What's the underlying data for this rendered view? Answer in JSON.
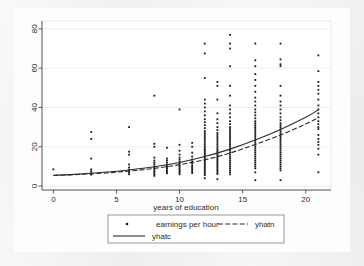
{
  "chart_data": {
    "type": "scatter",
    "title": "",
    "subtitle": "",
    "xlabel": "years of education",
    "ylabel": "",
    "xlim": [
      -0.9,
      22.0
    ],
    "ylim": [
      -2.0,
      84.0
    ],
    "xticks": [
      0,
      5,
      10,
      15,
      20
    ],
    "xtick_labels": [
      "0",
      "5",
      "10",
      "15",
      "20"
    ],
    "yticks": [
      0,
      20,
      40,
      60,
      80
    ],
    "ytick_labels": [
      "0",
      "20",
      "40",
      "60",
      "80"
    ],
    "grid": "horizontal-faint",
    "legend_position": "below-plot",
    "ytick_label_rotation": 90,
    "series": [
      {
        "name": "earnings per hour",
        "type": "scatter",
        "marker": "dot",
        "color": "#1a1a1a",
        "points": [
          [
            0,
            8.5
          ],
          [
            3,
            27.5
          ],
          [
            3,
            24.0
          ],
          [
            3,
            14.0
          ],
          [
            3,
            8.5
          ],
          [
            3,
            7.5
          ],
          [
            3,
            6.6
          ],
          [
            3,
            5.8
          ],
          [
            6,
            30.0
          ],
          [
            6,
            17.5
          ],
          [
            6,
            16.0
          ],
          [
            6,
            11.0
          ],
          [
            6,
            9.5
          ],
          [
            6,
            8.4
          ],
          [
            6,
            7.5
          ],
          [
            6,
            6.8
          ],
          [
            6,
            6.0
          ],
          [
            8,
            46.0
          ],
          [
            8,
            21.5
          ],
          [
            8,
            20.0
          ],
          [
            8,
            14.5
          ],
          [
            8,
            13.0
          ],
          [
            8,
            12.0
          ],
          [
            8,
            11.0
          ],
          [
            8,
            10.0
          ],
          [
            8,
            9.2
          ],
          [
            8,
            8.4
          ],
          [
            8,
            7.6
          ],
          [
            8,
            6.8
          ],
          [
            8,
            6.0
          ],
          [
            8,
            5.2
          ],
          [
            9,
            19.5
          ],
          [
            9,
            14.0
          ],
          [
            9,
            13.0
          ],
          [
            9,
            12.0
          ],
          [
            9,
            11.0
          ],
          [
            9,
            10.2
          ],
          [
            9,
            9.5
          ],
          [
            9,
            8.8
          ],
          [
            9,
            8.0
          ],
          [
            9,
            7.2
          ],
          [
            9,
            6.5
          ],
          [
            10,
            39.0
          ],
          [
            10,
            21.0
          ],
          [
            10,
            18.0
          ],
          [
            10,
            16.0
          ],
          [
            10,
            14.5
          ],
          [
            10,
            13.5
          ],
          [
            10,
            12.5
          ],
          [
            10,
            11.5
          ],
          [
            10,
            10.5
          ],
          [
            10,
            9.8
          ],
          [
            10,
            9.0
          ],
          [
            10,
            8.2
          ],
          [
            10,
            7.5
          ],
          [
            10,
            6.8
          ],
          [
            10,
            6.0
          ],
          [
            11,
            22.0
          ],
          [
            11,
            20.0
          ],
          [
            11,
            17.0
          ],
          [
            11,
            15.0
          ],
          [
            11,
            13.5
          ],
          [
            11,
            12.5
          ],
          [
            11,
            11.5
          ],
          [
            11,
            10.5
          ],
          [
            11,
            9.8
          ],
          [
            11,
            9.0
          ],
          [
            11,
            8.2
          ],
          [
            11,
            7.4
          ],
          [
            11,
            6.6
          ],
          [
            12,
            72.5
          ],
          [
            12,
            67.5
          ],
          [
            12,
            55.0
          ],
          [
            12,
            44.0
          ],
          [
            12,
            42.0
          ],
          [
            12,
            40.0
          ],
          [
            12,
            38.0
          ],
          [
            12,
            36.0
          ],
          [
            12,
            34.0
          ],
          [
            12,
            32.5
          ],
          [
            12,
            31.0
          ],
          [
            12,
            29.5
          ],
          [
            12,
            28.0
          ],
          [
            12,
            27.0
          ],
          [
            12,
            26.0
          ],
          [
            12,
            25.0
          ],
          [
            12,
            24.0
          ],
          [
            12,
            23.0
          ],
          [
            12,
            22.0
          ],
          [
            12,
            21.0
          ],
          [
            12,
            20.0
          ],
          [
            12,
            19.2
          ],
          [
            12,
            18.4
          ],
          [
            12,
            17.6
          ],
          [
            12,
            16.8
          ],
          [
            12,
            16.0
          ],
          [
            12,
            15.2
          ],
          [
            12,
            14.4
          ],
          [
            12,
            13.6
          ],
          [
            12,
            12.8
          ],
          [
            12,
            12.0
          ],
          [
            12,
            11.2
          ],
          [
            12,
            10.4
          ],
          [
            12,
            9.6
          ],
          [
            12,
            8.8
          ],
          [
            12,
            8.0
          ],
          [
            12,
            7.2
          ],
          [
            12,
            6.4
          ],
          [
            12,
            5.6
          ],
          [
            12,
            4.0
          ],
          [
            13,
            53.0
          ],
          [
            13,
            51.0
          ],
          [
            13,
            44.0
          ],
          [
            13,
            37.0
          ],
          [
            13,
            34.0
          ],
          [
            13,
            32.0
          ],
          [
            13,
            30.0
          ],
          [
            13,
            28.5
          ],
          [
            13,
            27.0
          ],
          [
            13,
            26.0
          ],
          [
            13,
            25.0
          ],
          [
            13,
            24.0
          ],
          [
            13,
            23.0
          ],
          [
            13,
            22.0
          ],
          [
            13,
            21.0
          ],
          [
            13,
            20.0
          ],
          [
            13,
            19.0
          ],
          [
            13,
            18.2
          ],
          [
            13,
            17.4
          ],
          [
            13,
            16.6
          ],
          [
            13,
            15.8
          ],
          [
            13,
            15.0
          ],
          [
            13,
            14.2
          ],
          [
            13,
            13.4
          ],
          [
            13,
            12.6
          ],
          [
            13,
            11.8
          ],
          [
            13,
            11.0
          ],
          [
            13,
            10.2
          ],
          [
            13,
            9.4
          ],
          [
            13,
            8.6
          ],
          [
            13,
            7.8
          ],
          [
            13,
            7.0
          ],
          [
            13,
            6.2
          ],
          [
            13,
            3.5
          ],
          [
            14,
            77.0
          ],
          [
            14,
            72.5
          ],
          [
            14,
            70.0
          ],
          [
            14,
            61.0
          ],
          [
            14,
            51.0
          ],
          [
            14,
            46.0
          ],
          [
            14,
            41.0
          ],
          [
            14,
            39.0
          ],
          [
            14,
            37.0
          ],
          [
            14,
            35.0
          ],
          [
            14,
            33.0
          ],
          [
            14,
            31.5
          ],
          [
            14,
            30.0
          ],
          [
            14,
            29.0
          ],
          [
            14,
            28.0
          ],
          [
            14,
            27.0
          ],
          [
            14,
            26.0
          ],
          [
            14,
            25.0
          ],
          [
            14,
            24.0
          ],
          [
            14,
            23.0
          ],
          [
            14,
            22.0
          ],
          [
            14,
            21.0
          ],
          [
            14,
            20.0
          ],
          [
            14,
            19.0
          ],
          [
            14,
            18.0
          ],
          [
            14,
            17.0
          ],
          [
            14,
            16.0
          ],
          [
            14,
            15.0
          ],
          [
            14,
            14.0
          ],
          [
            14,
            13.0
          ],
          [
            14,
            12.0
          ],
          [
            14,
            11.0
          ],
          [
            14,
            10.0
          ],
          [
            14,
            9.0
          ],
          [
            14,
            8.0
          ],
          [
            14,
            7.0
          ],
          [
            14,
            6.0
          ],
          [
            16,
            72.5
          ],
          [
            16,
            64.0
          ],
          [
            16,
            61.0
          ],
          [
            16,
            57.0
          ],
          [
            16,
            54.0
          ],
          [
            16,
            51.0
          ],
          [
            16,
            48.0
          ],
          [
            16,
            45.0
          ],
          [
            16,
            43.0
          ],
          [
            16,
            41.0
          ],
          [
            16,
            39.0
          ],
          [
            16,
            37.5
          ],
          [
            16,
            36.0
          ],
          [
            16,
            34.5
          ],
          [
            16,
            33.0
          ],
          [
            16,
            32.0
          ],
          [
            16,
            31.0
          ],
          [
            16,
            30.0
          ],
          [
            16,
            29.0
          ],
          [
            16,
            28.0
          ],
          [
            16,
            27.0
          ],
          [
            16,
            26.0
          ],
          [
            16,
            25.0
          ],
          [
            16,
            24.0
          ],
          [
            16,
            23.0
          ],
          [
            16,
            22.0
          ],
          [
            16,
            21.0
          ],
          [
            16,
            20.0
          ],
          [
            16,
            19.0
          ],
          [
            16,
            18.0
          ],
          [
            16,
            17.0
          ],
          [
            16,
            16.0
          ],
          [
            16,
            15.0
          ],
          [
            16,
            14.0
          ],
          [
            16,
            13.0
          ],
          [
            16,
            12.0
          ],
          [
            16,
            11.0
          ],
          [
            16,
            10.0
          ],
          [
            16,
            9.0
          ],
          [
            16,
            7.0
          ],
          [
            16,
            3.0
          ],
          [
            18,
            72.5
          ],
          [
            18,
            64.5
          ],
          [
            18,
            62.0
          ],
          [
            18,
            61.0
          ],
          [
            18,
            51.0
          ],
          [
            18,
            46.0
          ],
          [
            18,
            43.0
          ],
          [
            18,
            41.0
          ],
          [
            18,
            39.0
          ],
          [
            18,
            37.0
          ],
          [
            18,
            35.0
          ],
          [
            18,
            33.5
          ],
          [
            18,
            32.0
          ],
          [
            18,
            31.0
          ],
          [
            18,
            30.0
          ],
          [
            18,
            29.0
          ],
          [
            18,
            28.0
          ],
          [
            18,
            27.0
          ],
          [
            18,
            26.0
          ],
          [
            18,
            25.0
          ],
          [
            18,
            24.0
          ],
          [
            18,
            23.0
          ],
          [
            18,
            22.0
          ],
          [
            18,
            21.0
          ],
          [
            18,
            20.0
          ],
          [
            18,
            19.0
          ],
          [
            18,
            18.0
          ],
          [
            18,
            17.0
          ],
          [
            18,
            16.0
          ],
          [
            18,
            15.0
          ],
          [
            18,
            14.0
          ],
          [
            18,
            13.0
          ],
          [
            18,
            12.0
          ],
          [
            18,
            11.0
          ],
          [
            18,
            10.0
          ],
          [
            18,
            9.0
          ],
          [
            18,
            8.0
          ],
          [
            18,
            3.0
          ],
          [
            21,
            66.5
          ],
          [
            21,
            58.5
          ],
          [
            21,
            53.0
          ],
          [
            21,
            51.0
          ],
          [
            21,
            49.0
          ],
          [
            21,
            47.0
          ],
          [
            21,
            44.0
          ],
          [
            21,
            41.0
          ],
          [
            21,
            39.0
          ],
          [
            21,
            37.0
          ],
          [
            21,
            35.0
          ],
          [
            21,
            33.0
          ],
          [
            21,
            31.5
          ],
          [
            21,
            30.0
          ],
          [
            21,
            29.0
          ],
          [
            21,
            26.0
          ],
          [
            21,
            24.0
          ],
          [
            21,
            22.5
          ],
          [
            21,
            21.0
          ],
          [
            21,
            19.0
          ],
          [
            21,
            16.0
          ],
          [
            21,
            7.0
          ]
        ]
      },
      {
        "name": "yhatn",
        "type": "line",
        "style": "dashed",
        "color": "#2b2b2b",
        "x": [
          0,
          2,
          4,
          6,
          8,
          10,
          12,
          14,
          16,
          18,
          20,
          21
        ],
        "y": [
          5.4,
          5.9,
          6.6,
          7.6,
          9.0,
          10.9,
          13.4,
          16.8,
          21.2,
          26.0,
          31.6,
          34.8
        ]
      },
      {
        "name": "yhatc",
        "type": "line",
        "style": "solid",
        "color": "#2b2b2b",
        "x": [
          0,
          2,
          4,
          6,
          8,
          10,
          12,
          14,
          16,
          18,
          20,
          21
        ],
        "y": [
          5.5,
          6.1,
          7.0,
          8.2,
          9.8,
          12.0,
          15.0,
          18.8,
          23.4,
          28.8,
          35.0,
          38.8
        ]
      }
    ]
  },
  "legend": {
    "items": [
      {
        "label": "earnings per hour",
        "marker": "dot"
      },
      {
        "label": "yhatn",
        "marker": "dashed-line"
      },
      {
        "label": "yhatc",
        "marker": "solid-line"
      }
    ]
  },
  "colors": {
    "marker": "#1a1a1a",
    "line": "#2b2b2b",
    "axis": "#4a4a4a",
    "grid": "#e2e2e2",
    "plot_background": "#ffffff",
    "page_background": "#efefee",
    "legend_border": "#6b6b6b"
  }
}
